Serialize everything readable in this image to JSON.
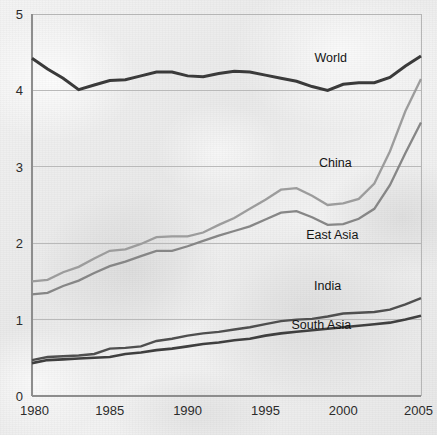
{
  "chart_data": {
    "type": "line",
    "title": "",
    "subtitle": "",
    "xlabel": "",
    "ylabel": "",
    "xlim": [
      1980,
      2005
    ],
    "ylim": [
      0,
      5
    ],
    "grid": true,
    "legend_position": "inline-labels",
    "x_ticks": [
      "1980",
      "1985",
      "1990",
      "1995",
      "2000",
      "2005"
    ],
    "x_tick_values": [
      1980,
      1985,
      1990,
      1995,
      2000,
      2005
    ],
    "y_ticks": [
      "0",
      "1",
      "2",
      "3",
      "4",
      "5"
    ],
    "y_tick_values": [
      0,
      1,
      2,
      3,
      4,
      5
    ],
    "x": [
      1980,
      1981,
      1982,
      1983,
      1984,
      1985,
      1986,
      1987,
      1988,
      1989,
      1990,
      1991,
      1992,
      1993,
      1994,
      1995,
      1996,
      1997,
      1998,
      1999,
      2000,
      2001,
      2002,
      2003,
      2004,
      2005
    ],
    "series": [
      {
        "name": "World",
        "color": "#3a3a3a",
        "width": 3.0,
        "label": "World",
        "label_x": 1999.2,
        "label_y": 4.37,
        "values": [
          4.42,
          4.28,
          4.16,
          4.01,
          4.07,
          4.13,
          4.14,
          4.19,
          4.24,
          4.24,
          4.19,
          4.18,
          4.22,
          4.25,
          4.24,
          4.2,
          4.16,
          4.12,
          4.05,
          4.0,
          4.08,
          4.1,
          4.1,
          4.17,
          4.32,
          4.45
        ]
      },
      {
        "name": "China",
        "color": "#9c9c9c",
        "width": 2.3,
        "label": "China",
        "label_x": 1999.5,
        "label_y": 3.0,
        "values": [
          1.5,
          1.52,
          1.62,
          1.69,
          1.8,
          1.9,
          1.92,
          1.99,
          2.08,
          2.09,
          2.09,
          2.14,
          2.24,
          2.33,
          2.45,
          2.57,
          2.7,
          2.72,
          2.62,
          2.5,
          2.52,
          2.58,
          2.78,
          3.2,
          3.73,
          4.15
        ]
      },
      {
        "name": "East Asia",
        "color": "#868686",
        "width": 2.3,
        "label": "East Asia",
        "label_x": 1999.3,
        "label_y": 2.06,
        "values": [
          1.33,
          1.35,
          1.44,
          1.51,
          1.61,
          1.7,
          1.76,
          1.83,
          1.9,
          1.9,
          1.96,
          2.03,
          2.1,
          2.16,
          2.22,
          2.31,
          2.4,
          2.42,
          2.34,
          2.24,
          2.25,
          2.32,
          2.45,
          2.76,
          3.18,
          3.58
        ]
      },
      {
        "name": "India",
        "color": "#4f4f4f",
        "width": 2.4,
        "label": "India",
        "label_x": 1999.0,
        "label_y": 1.39,
        "values": [
          0.47,
          0.51,
          0.52,
          0.53,
          0.55,
          0.62,
          0.63,
          0.65,
          0.72,
          0.75,
          0.79,
          0.82,
          0.84,
          0.87,
          0.9,
          0.94,
          0.98,
          1.0,
          1.01,
          1.04,
          1.08,
          1.09,
          1.1,
          1.13,
          1.2,
          1.28
        ]
      },
      {
        "name": "South Asia",
        "color": "#3f3f3f",
        "width": 2.6,
        "label": "South Asia",
        "label_x": 1998.6,
        "label_y": 0.88,
        "values": [
          0.43,
          0.47,
          0.48,
          0.49,
          0.5,
          0.51,
          0.55,
          0.57,
          0.6,
          0.62,
          0.65,
          0.68,
          0.7,
          0.73,
          0.75,
          0.79,
          0.82,
          0.84,
          0.86,
          0.88,
          0.9,
          0.92,
          0.94,
          0.96,
          1.0,
          1.05
        ]
      }
    ]
  }
}
